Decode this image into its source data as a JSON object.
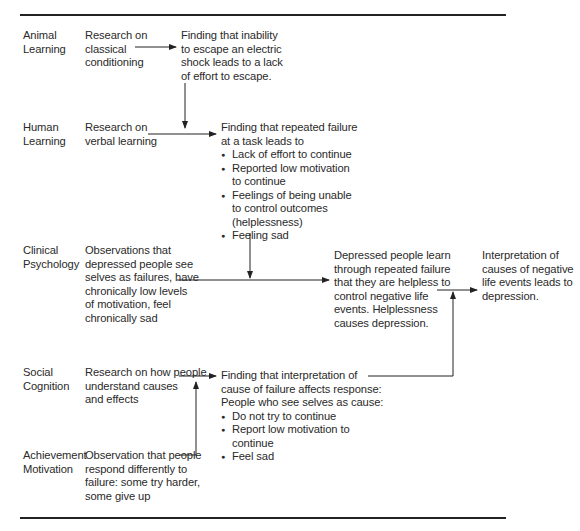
{
  "diagram": {
    "rows": [
      {
        "domain": [
          "Animal",
          "Learning"
        ],
        "source": [
          "Research on",
          "classical",
          "conditioning"
        ]
      },
      {
        "domain": [
          "Human",
          "Learning"
        ],
        "source": [
          "Research on",
          "verbal learning"
        ]
      },
      {
        "domain": [
          "Clinical",
          "Psychology"
        ],
        "source": [
          "Observations that",
          "depressed people see",
          "selves as failures, have",
          "chronically low levels",
          "of motivation, feel",
          "chronically sad"
        ]
      },
      {
        "domain": [
          "Social",
          "Cognition"
        ],
        "source": [
          "Research on how people",
          "understand causes",
          "and effects"
        ]
      },
      {
        "domain": [
          "Achievement",
          "Motivation"
        ],
        "source": [
          "Observation that people",
          "respond differently to",
          "failure: some try harder,",
          "some give up"
        ]
      }
    ],
    "findings": {
      "animal": [
        "Finding that inability",
        "to escape an electric",
        "shock leads to a lack",
        "of effort to escape."
      ],
      "human": {
        "intro": [
          "Finding that repeated failure",
          "at a task leads to"
        ],
        "bullets": [
          [
            "Lack of effort to continue"
          ],
          [
            "Reported low motivation",
            "to continue"
          ],
          [
            "Feelings of being unable",
            "to control outcomes",
            "(helplessness)"
          ],
          [
            "Feeling sad"
          ]
        ]
      },
      "social": {
        "intro": [
          "Finding that interpretation of",
          "cause of failure affects response:",
          "People who see selves as cause:"
        ],
        "bullets": [
          [
            "Do not try to continue"
          ],
          [
            "Report low motivation to",
            "continue"
          ],
          [
            "Feel sad"
          ]
        ]
      }
    },
    "synthesis": [
      "Depressed people learn",
      "through repeated failure",
      "that they are helpless to",
      "control negative life",
      "events. Helplessness",
      "causes depression."
    ],
    "conclusion": [
      "Interpretation of",
      "causes of negative",
      "life events leads to",
      "depression."
    ]
  }
}
